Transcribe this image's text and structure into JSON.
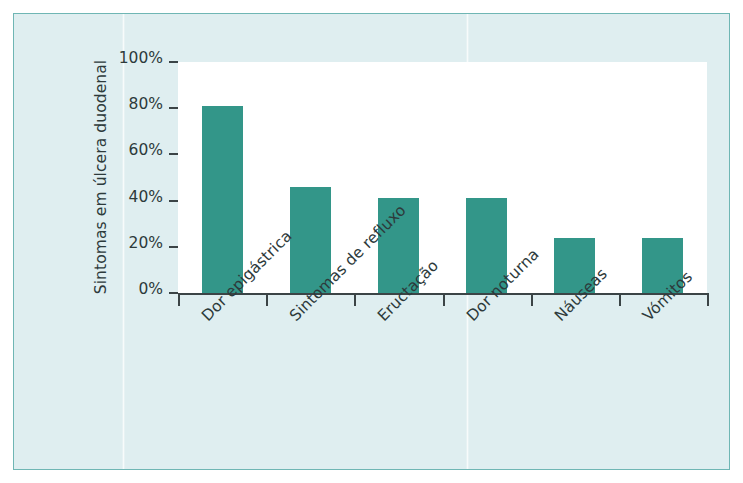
{
  "figure": {
    "panel_bg": "#dfeef0",
    "panel_border": "#6fb6b4",
    "plot_bg": "#ffffff",
    "axis_color": "#3b4446"
  },
  "chart_data": {
    "type": "bar",
    "title": "",
    "subtitle": "",
    "xlabel": "",
    "ylabel": "Sintomas em úlcera duodenal",
    "categories": [
      "Dor epigástrica",
      "Sintomas de refluxo",
      "Eructação",
      "Dor noturna",
      "Náuseas",
      "Vómitos"
    ],
    "values": [
      81,
      46,
      41,
      41,
      24,
      24
    ],
    "value_labels": [
      "81%",
      "46%",
      "41%",
      "41%",
      "24%",
      "24%"
    ],
    "ylim": [
      0,
      100
    ],
    "ytick_values": [
      0,
      20,
      40,
      60,
      80,
      100
    ],
    "ytick_labels": [
      "0%",
      "20%",
      "40%",
      "60%",
      "80%",
      "100%"
    ],
    "grid": false,
    "legend": null,
    "legend_position": "none",
    "bar_color": "#339689",
    "annotations": []
  }
}
